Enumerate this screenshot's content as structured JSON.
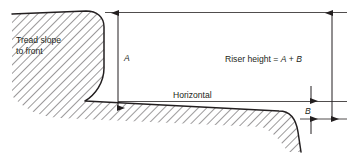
{
  "figure": {
    "type": "technical-cross-section-diagram",
    "background_color": "#ffffff",
    "line_color": "#231f20",
    "hatch_color": "#231f20"
  },
  "labels": {
    "tread_slope_line1": "Tread slope",
    "tread_slope_line2": "to front",
    "dimension_a": "A",
    "dimension_b": "B",
    "horizontal": "Horizontal",
    "riser_formula_prefix": "Riser height = ",
    "riser_formula_a": "A",
    "riser_formula_plus": " + ",
    "riser_formula_b": "B"
  },
  "dimensions": {
    "a": {
      "name": "A",
      "description": "Vertical height from horizontal tread line to top of tread",
      "x": 118,
      "y_top": 13,
      "y_bottom": 108
    },
    "b": {
      "name": "B",
      "description": "Vertical drop of the front nosing below the horizontal line",
      "x": 311,
      "y_top": 101,
      "y_bottom": 119
    },
    "total": {
      "name": "A + B",
      "description": "Total riser height",
      "x": 332,
      "y_top": 13,
      "y_bottom": 119
    }
  }
}
